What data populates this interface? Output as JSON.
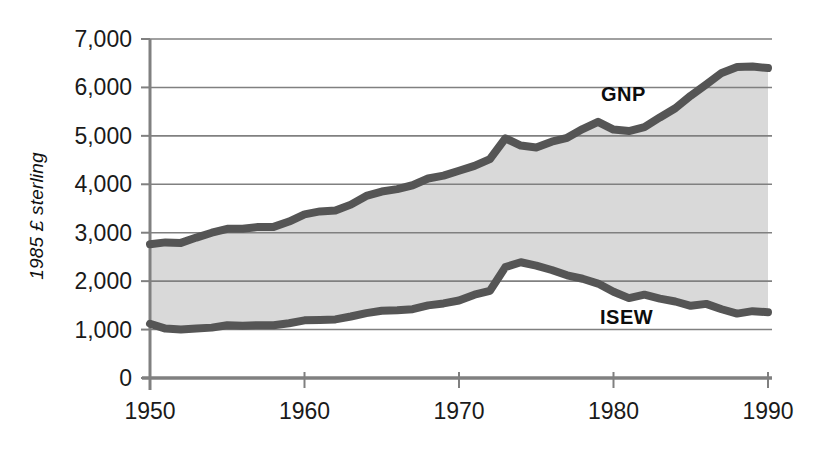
{
  "chart_data": {
    "type": "area",
    "title": "",
    "subtitle": "",
    "xlabel": "",
    "ylabel": "1985 £ sterling",
    "xlim": [
      1950,
      1990
    ],
    "ylim": [
      0,
      7000
    ],
    "grid": true,
    "legend_position": "inline-annotation",
    "x_ticks": [
      "1950",
      "1960",
      "1970",
      "1980",
      "1990"
    ],
    "x_tick_values": [
      1950,
      1960,
      1970,
      1980,
      1990
    ],
    "y_ticks": [
      "0",
      "1,000",
      "2,000",
      "3,000",
      "4,000",
      "5,000",
      "6,000",
      "7,000"
    ],
    "y_tick_values": [
      0,
      1000,
      2000,
      3000,
      4000,
      5000,
      6000,
      7000
    ],
    "annotations": [
      {
        "text": "GNP",
        "x": 1979.5,
        "y": 5700
      },
      {
        "text": "ISEW",
        "x": 1979.4,
        "y": 1500
      }
    ],
    "colors": {
      "line": "#555555",
      "fill": "#d9d9d9",
      "grid": "#808080",
      "axis": "#808080",
      "text": "#1a1a1a"
    },
    "x": [
      1950,
      1951,
      1952,
      1953,
      1954,
      1955,
      1956,
      1957,
      1958,
      1959,
      1960,
      1961,
      1962,
      1963,
      1964,
      1965,
      1966,
      1967,
      1968,
      1969,
      1970,
      1971,
      1972,
      1973,
      1974,
      1975,
      1976,
      1977,
      1978,
      1979,
      1980,
      1981,
      1982,
      1983,
      1984,
      1985,
      1986,
      1987,
      1988,
      1989,
      1990
    ],
    "series": [
      {
        "name": "GNP",
        "values": [
          2760,
          2800,
          2790,
          2900,
          3000,
          3080,
          3080,
          3120,
          3120,
          3230,
          3380,
          3440,
          3460,
          3580,
          3760,
          3850,
          3900,
          3980,
          4120,
          4180,
          4280,
          4380,
          4520,
          4950,
          4800,
          4760,
          4880,
          4960,
          5140,
          5290,
          5130,
          5100,
          5180,
          5380,
          5570,
          5830,
          6060,
          6300,
          6420,
          6430,
          6400
        ]
      },
      {
        "name": "ISEW",
        "values": [
          1120,
          1020,
          1000,
          1020,
          1040,
          1090,
          1080,
          1090,
          1090,
          1130,
          1190,
          1200,
          1210,
          1270,
          1340,
          1390,
          1400,
          1420,
          1500,
          1540,
          1600,
          1720,
          1800,
          2290,
          2390,
          2320,
          2230,
          2120,
          2050,
          1950,
          1780,
          1650,
          1720,
          1640,
          1580,
          1490,
          1530,
          1420,
          1330,
          1380,
          1360
        ]
      }
    ]
  },
  "axis": {
    "y_title": "1985 £ sterling"
  },
  "labels": {
    "gnp": "GNP",
    "isew": "ISEW"
  }
}
